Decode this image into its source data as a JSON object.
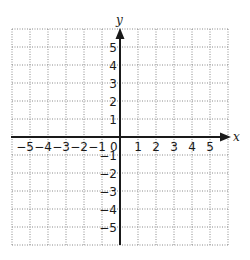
{
  "chart_data": {
    "type": "coordinate-plane",
    "title": "",
    "xlabel": "x",
    "ylabel": "y",
    "xlim": [
      -6,
      6
    ],
    "ylim": [
      -6,
      6
    ],
    "grid": true,
    "grid_style": "dotted",
    "x_ticks": [
      -5,
      -4,
      -3,
      -2,
      -1,
      0,
      1,
      2,
      3,
      4,
      5
    ],
    "y_ticks": [
      -5,
      -4,
      -3,
      -2,
      -1,
      1,
      2,
      3,
      4,
      5
    ],
    "x_tick_labels": [
      "−5",
      "−4",
      "−3",
      "−2",
      "−1",
      "0",
      "1",
      "2",
      "3",
      "4",
      "5"
    ],
    "y_tick_labels": [
      "−5",
      "−4",
      "−3",
      "−2",
      "−1",
      "1",
      "2",
      "3",
      "4",
      "5"
    ],
    "data_points": []
  },
  "plane": {
    "x_axis_label": "x",
    "y_axis_label": "y",
    "origin_label": "0",
    "x_labels": [
      {
        "v": -5,
        "t": "−5"
      },
      {
        "v": -4,
        "t": "−4"
      },
      {
        "v": -3,
        "t": "−3"
      },
      {
        "v": -2,
        "t": "−2"
      },
      {
        "v": -1,
        "t": "−1"
      },
      {
        "v": 1,
        "t": "1"
      },
      {
        "v": 2,
        "t": "2"
      },
      {
        "v": 3,
        "t": "3"
      },
      {
        "v": 4,
        "t": "4"
      },
      {
        "v": 5,
        "t": "5"
      }
    ],
    "y_labels": [
      {
        "v": 5,
        "t": "5"
      },
      {
        "v": 4,
        "t": "4"
      },
      {
        "v": 3,
        "t": "3"
      },
      {
        "v": 2,
        "t": "2"
      },
      {
        "v": 1,
        "t": "1"
      },
      {
        "v": -1,
        "t": "−1"
      },
      {
        "v": -2,
        "t": "−2"
      },
      {
        "v": -3,
        "t": "−3"
      },
      {
        "v": -4,
        "t": "−4"
      },
      {
        "v": -5,
        "t": "−5"
      }
    ],
    "colors": {
      "axis": "#1a1a1a",
      "grid": "#8a8a8a",
      "text": "#1a1a1a"
    }
  }
}
